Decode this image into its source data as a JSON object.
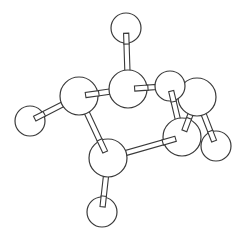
{
  "diagram": {
    "type": "ball-and-stick molecular model",
    "colors": {
      "background": "#ffffff",
      "stroke": "#3a3a3a",
      "fill": "#ffffff"
    },
    "atoms": [
      {
        "id": "a_top",
        "x": 126,
        "y": 28,
        "r": 15
      },
      {
        "id": "a_center",
        "x": 128,
        "y": 89,
        "r": 19
      },
      {
        "id": "a_left",
        "x": 79,
        "y": 96,
        "r": 19
      },
      {
        "id": "a_left_small",
        "x": 30,
        "y": 121,
        "r": 15
      },
      {
        "id": "a_right_top",
        "x": 170,
        "y": 86,
        "r": 15
      },
      {
        "id": "a_far_right",
        "x": 197,
        "y": 97,
        "r": 19
      },
      {
        "id": "a_lower_right",
        "x": 182,
        "y": 137,
        "r": 19
      },
      {
        "id": "a_far_right_small",
        "x": 216,
        "y": 146,
        "r": 15
      },
      {
        "id": "a_bottom_center",
        "x": 108,
        "y": 158,
        "r": 19
      },
      {
        "id": "a_bottom",
        "x": 102,
        "y": 212,
        "r": 15
      }
    ],
    "bonds": [
      {
        "from": "a_top",
        "to": "a_center"
      },
      {
        "from": "a_left",
        "to": "a_center"
      },
      {
        "from": "a_center",
        "to": "a_right_top"
      },
      {
        "from": "a_left",
        "to": "a_left_small"
      },
      {
        "from": "a_left",
        "to": "a_bottom_center"
      },
      {
        "from": "a_bottom_center",
        "to": "a_lower_right"
      },
      {
        "from": "a_bottom_center",
        "to": "a_bottom"
      },
      {
        "from": "a_right_top",
        "to": "a_lower_right"
      },
      {
        "from": "a_far_right",
        "to": "a_lower_right"
      },
      {
        "from": "a_far_right",
        "to": "a_far_right_small"
      }
    ]
  }
}
